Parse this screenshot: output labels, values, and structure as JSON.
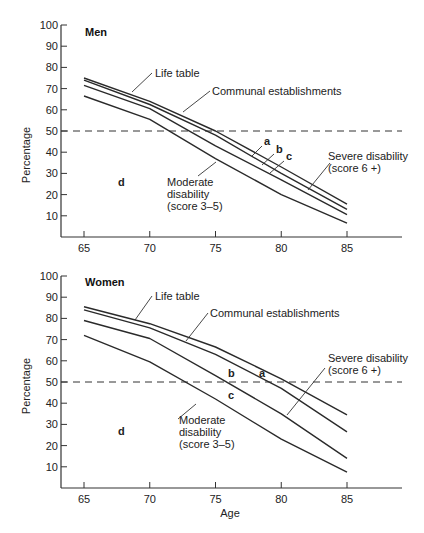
{
  "chart_data": [
    {
      "type": "line",
      "title": "Men",
      "xlabel": "",
      "ylabel": "Percentage",
      "x": [
        65,
        70,
        75,
        80,
        85
      ],
      "xticks": [
        "65",
        "70",
        "75",
        "80",
        "85"
      ],
      "yticks": [
        "10",
        "20",
        "30",
        "40",
        "50",
        "60",
        "70",
        "80",
        "90",
        "100"
      ],
      "ylim": [
        0,
        100
      ],
      "xlim": [
        63.3,
        89
      ],
      "grid": false,
      "reference_line": {
        "y": 50,
        "style": "dashed"
      },
      "series": [
        {
          "name": "Life table",
          "values": [
            75,
            64,
            50,
            33,
            15.5
          ]
        },
        {
          "name": "Communal establishments",
          "values": [
            74,
            62.5,
            48,
            30,
            13
          ]
        },
        {
          "name": "Severe disability (score 6 +)",
          "values": [
            71.5,
            60.5,
            43,
            27,
            10.5
          ]
        },
        {
          "name": "Moderate disability (score 3-5)",
          "values": [
            66.5,
            55.5,
            37,
            20,
            6.5
          ]
        }
      ],
      "region_labels": [
        "a",
        "b",
        "c",
        "d"
      ],
      "annotations": [
        "Life table",
        "Communal establishments",
        "Severe disability",
        "(score 6 +)",
        "Moderate",
        "disability",
        "(score 3–5)"
      ]
    },
    {
      "type": "line",
      "title": "Women",
      "xlabel": "Age",
      "ylabel": "Percentage",
      "x": [
        65,
        70,
        75,
        80,
        85
      ],
      "xticks": [
        "65",
        "70",
        "75",
        "80",
        "85"
      ],
      "yticks": [
        "10",
        "20",
        "30",
        "40",
        "50",
        "60",
        "70",
        "80",
        "90",
        "100"
      ],
      "ylim": [
        0,
        100
      ],
      "xlim": [
        63.3,
        89
      ],
      "grid": false,
      "reference_line": {
        "y": 50,
        "style": "dashed"
      },
      "series": [
        {
          "name": "Life table",
          "values": [
            85.5,
            77.5,
            66.5,
            51.5,
            34.5
          ]
        },
        {
          "name": "Communal establishments",
          "values": [
            84,
            75.5,
            63,
            47,
            26.5
          ]
        },
        {
          "name": "Severe disability (score 6 +)",
          "values": [
            79,
            70.5,
            53,
            35,
            14
          ]
        },
        {
          "name": "Moderate disability (score 3-5)",
          "values": [
            72,
            59.5,
            42,
            23,
            7.5
          ]
        }
      ],
      "region_labels": [
        "a",
        "b",
        "c",
        "d"
      ],
      "annotations": [
        "Life table",
        "Communal establishments",
        "Severe disability",
        "(score 6 +)",
        "Moderate",
        "disability",
        "(score 3–5)"
      ]
    }
  ],
  "panels": {
    "men": {
      "title": "Men",
      "ylabel": "Percentage",
      "life_table": "Life table",
      "communal": "Communal establishments",
      "severe_1": "Severe disability",
      "severe_2": "(score 6 +)",
      "moderate_1": "Moderate",
      "moderate_2": "disability",
      "moderate_3": "(score 3–5)",
      "a": "a",
      "b": "b",
      "c": "c",
      "d": "d"
    },
    "women": {
      "title": "Women",
      "ylabel": "Percentage",
      "xlabel": "Age",
      "life_table": "Life table",
      "communal": "Communal establishments",
      "severe_1": "Severe disability",
      "severe_2": "(score 6 +)",
      "moderate_1": "Moderate",
      "moderate_2": "disability",
      "moderate_3": "(score 3–5)",
      "a": "a",
      "b": "b",
      "c": "c",
      "d": "d"
    }
  },
  "style": {
    "line_color": "#2a2a2a",
    "axis_color": "#333333"
  }
}
